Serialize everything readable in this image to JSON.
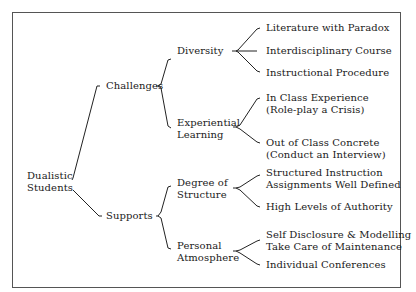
{
  "diagram": {
    "type": "tree",
    "root": {
      "label_lines": [
        "Dualistic",
        "Students"
      ],
      "children": [
        {
          "label": "Challenges",
          "children": [
            {
              "label_lines": [
                "Diversity"
              ],
              "children": [
                {
                  "label_lines": [
                    "Literature with Paradox"
                  ]
                },
                {
                  "label_lines": [
                    "Interdisciplinary Course"
                  ]
                },
                {
                  "label_lines": [
                    "Instructional Procedure"
                  ]
                }
              ]
            },
            {
              "label_lines": [
                "Experiential",
                "Learning"
              ],
              "children": [
                {
                  "label_lines": [
                    "In Class Experience",
                    "(Role-play a Crisis)"
                  ]
                },
                {
                  "label_lines": [
                    "Out of Class Concrete",
                    "(Conduct an Interview)"
                  ]
                }
              ]
            }
          ]
        },
        {
          "label": "Supports",
          "children": [
            {
              "label_lines": [
                "Degree of",
                "Structure"
              ],
              "children": [
                {
                  "label_lines": [
                    "Structured Instruction",
                    "Assignments Well Defined"
                  ]
                },
                {
                  "label_lines": [
                    "High Levels of Authority"
                  ]
                }
              ]
            },
            {
              "label_lines": [
                "Personal",
                "Atmosphere"
              ],
              "children": [
                {
                  "label_lines": [
                    "Self Disclosure & Modelling",
                    "Take Care of Maintenance"
                  ]
                },
                {
                  "label_lines": [
                    "Individual Conferences"
                  ]
                }
              ]
            }
          ]
        }
      ]
    }
  },
  "labels": {
    "root_1": "Dualistic",
    "root_2": "Students",
    "challenges": "Challenges",
    "supports": "Supports",
    "diversity": "Diversity",
    "experiential_1": "Experiential",
    "experiential_2": "Learning",
    "degree_1": "Degree of",
    "degree_2": "Structure",
    "personal_1": "Personal",
    "personal_2": "Atmosphere",
    "lit": "Literature with Paradox",
    "inter": "Interdisciplinary Course",
    "instr": "Instructional Procedure",
    "inclass_1": "In Class Experience",
    "inclass_2": "(Role-play a Crisis)",
    "outclass_1": "Out of Class Concrete",
    "outclass_2": "(Conduct an Interview)",
    "struct_1": "Structured Instruction",
    "struct_2": "Assignments Well Defined",
    "authority": "High Levels of Authority",
    "self_1": "Self Disclosure & Modelling",
    "self_2": "Take Care of Maintenance",
    "indiv": "Individual Conferences"
  }
}
